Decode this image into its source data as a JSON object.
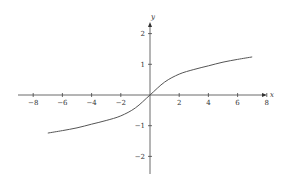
{
  "chart_data": {
    "type": "line",
    "title": "",
    "xlabel": "x",
    "ylabel": "y",
    "xlim": [
      -9,
      8
    ],
    "ylim": [
      -2.5,
      2.5
    ],
    "grid": false,
    "legend": null,
    "x_ticks": [
      -8,
      -6,
      -4,
      -2,
      2,
      4,
      6,
      8
    ],
    "y_ticks": [
      -2,
      -1,
      1,
      2
    ],
    "series": [
      {
        "name": "curve",
        "x": [
          -7,
          -6,
          -5,
          -4,
          -3,
          -2,
          -1,
          0,
          1,
          2,
          3,
          4,
          5,
          6,
          7
        ],
        "y": [
          -1.24,
          -1.16,
          -1.07,
          -0.95,
          -0.83,
          -0.68,
          -0.42,
          0,
          0.42,
          0.68,
          0.83,
          0.95,
          1.07,
          1.16,
          1.24
        ]
      }
    ],
    "colors": {
      "axis": "#444444",
      "curve": "#555555",
      "text": "#333333"
    }
  }
}
